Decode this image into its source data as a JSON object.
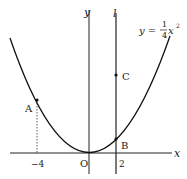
{
  "diagram": {
    "axes": {
      "x_label": "x",
      "y_label": "y",
      "origin_label": "O"
    },
    "curve": {
      "equation_lhs": "y =",
      "frac_num": "1",
      "frac_den": "4",
      "var": "x",
      "exp": "2"
    },
    "line": {
      "label": "l",
      "x_value": 2
    },
    "ticks": {
      "neg4": "−4",
      "two": "2"
    },
    "points": [
      {
        "name": "A",
        "x": -4,
        "y": 4
      },
      {
        "name": "B",
        "x": 2,
        "y": 1
      },
      {
        "name": "C",
        "x": 2,
        "y": 6
      }
    ]
  }
}
